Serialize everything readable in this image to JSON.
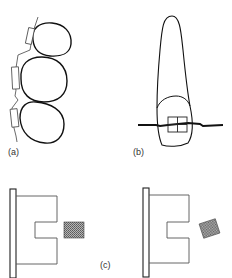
{
  "figure": {
    "panels": [
      {
        "id": "a",
        "label": "(a)",
        "description": "Three teeth in a row with brackets and stepped archwire on the labial side"
      },
      {
        "id": "b",
        "label": "(b)",
        "description": "Single incisor tooth with bracket and horizontal archwire"
      },
      {
        "id": "c",
        "label": "(c)",
        "description": "Bracket slot cross-sections: rectangular wire outside slot, untwisted (left) and rotated (right)"
      }
    ],
    "colors": {
      "stroke": "#111111",
      "thin_stroke": "#444444",
      "hatch_fill": "#8a8a8a",
      "background": "#ffffff"
    }
  }
}
